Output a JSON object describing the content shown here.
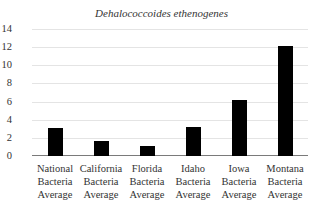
{
  "chart_data": {
    "type": "bar",
    "title": "Dehalococcoides ethenogenes",
    "xlabel": "",
    "ylabel": "",
    "categories": [
      "National Bacteria Average",
      "California Bacteria Average",
      "Florida Bacteria Average",
      "Idaho Bacteria Average",
      "Iowa Bacteria Average",
      "Montana Bacteria Average"
    ],
    "category_lines": [
      [
        "National",
        "Bacteria",
        "Average"
      ],
      [
        "California",
        "Bacteria",
        "Average"
      ],
      [
        "Florida",
        "Bacteria",
        "Average"
      ],
      [
        "Idaho",
        "Bacteria",
        "Average"
      ],
      [
        "Iowa",
        "Bacteria",
        "Average"
      ],
      [
        "Montana",
        "Bacteria",
        "Average"
      ]
    ],
    "values": [
      3.1,
      1.7,
      1.1,
      3.2,
      6.2,
      12.1
    ],
    "ylim": [
      0,
      14
    ],
    "yticks": [
      0,
      2,
      4,
      6,
      8,
      10,
      12,
      14
    ],
    "grid": true,
    "legend": null,
    "bar_color": "#000000"
  }
}
